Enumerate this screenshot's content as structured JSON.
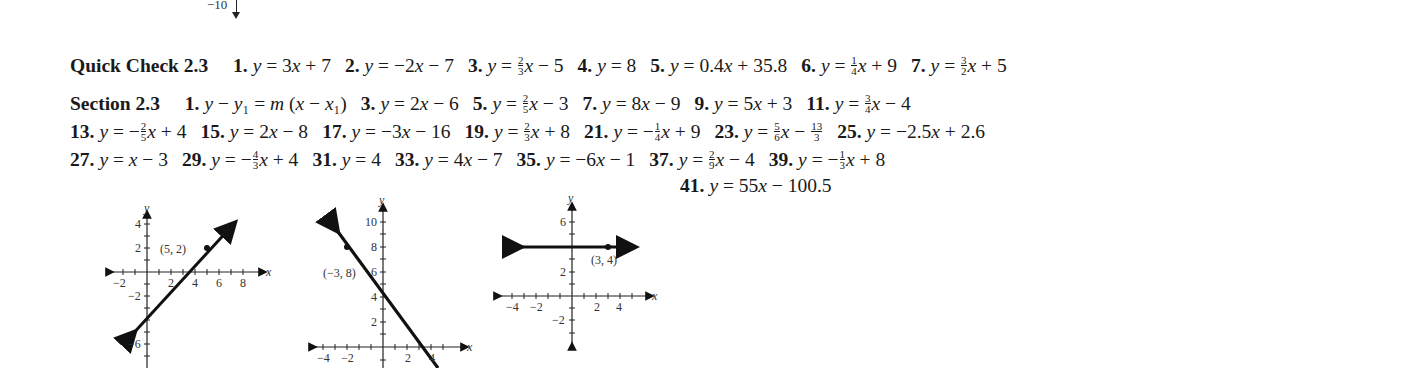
{
  "fragment_top": {
    "label": "−10"
  },
  "quick_check": {
    "heading": "Quick Check 2.3",
    "answers": [
      {
        "num": "1.",
        "pre": "y = 3x + 7"
      },
      {
        "num": "2.",
        "pre": "y = −2x − 7"
      },
      {
        "num": "3.",
        "pre": "y = ",
        "frac": [
          "2",
          "3"
        ],
        "post": "x − 5"
      },
      {
        "num": "4.",
        "pre": "y = 8"
      },
      {
        "num": "5.",
        "pre": "y = 0.4x + 35.8"
      },
      {
        "num": "6.",
        "pre": "y = ",
        "frac": [
          "1",
          "4"
        ],
        "post": "x + 9"
      },
      {
        "num": "7.",
        "pre": "y = ",
        "frac": [
          "3",
          "2"
        ],
        "post": "x + 5"
      }
    ]
  },
  "section": {
    "heading": "Section 2.3",
    "lines": [
      [
        {
          "num": "1.",
          "pre": "y − y₁ = m (x − x₁)"
        },
        {
          "num": "3.",
          "pre": "y = 2x − 6"
        },
        {
          "num": "5.",
          "pre": "y = ",
          "frac": [
            "2",
            "5"
          ],
          "post": "x − 3"
        },
        {
          "num": "7.",
          "pre": "y = 8x − 9"
        },
        {
          "num": "9.",
          "pre": "y = 5x + 3"
        },
        {
          "num": "11.",
          "pre": "y = ",
          "frac": [
            "3",
            "4"
          ],
          "post": "x − 4"
        }
      ],
      [
        {
          "num": "13.",
          "pre": "y = −",
          "frac": [
            "2",
            "5"
          ],
          "post": "x + 4"
        },
        {
          "num": "15.",
          "pre": "y = 2x − 8"
        },
        {
          "num": "17.",
          "pre": "y = −3x − 16"
        },
        {
          "num": "19.",
          "pre": "y = ",
          "frac": [
            "2",
            "3"
          ],
          "post": "x + 8"
        },
        {
          "num": "21.",
          "pre": "y = −",
          "frac": [
            "1",
            "4"
          ],
          "post": "x + 9"
        },
        {
          "num": "23.",
          "pre": "y = ",
          "frac": [
            "5",
            "6"
          ],
          "post": "x − ",
          "frac2": [
            "13",
            "3"
          ]
        },
        {
          "num": "25.",
          "pre": "y = −2.5x + 2.6"
        }
      ],
      [
        {
          "num": "27.",
          "pre": "y = x − 3"
        },
        {
          "num": "29.",
          "pre": "y = −",
          "frac": [
            "4",
            "3"
          ],
          "post": "x + 4"
        },
        {
          "num": "31.",
          "pre": "y = 4"
        },
        {
          "num": "33.",
          "pre": "y = 4x − 7"
        },
        {
          "num": "35.",
          "pre": "y = −6x − 1"
        },
        {
          "num": "37.",
          "pre": "y = ",
          "frac": [
            "2",
            "9"
          ],
          "post": "x − 4"
        },
        {
          "num": "39.",
          "pre": "y = −",
          "frac": [
            "1",
            "3"
          ],
          "post": "x + 8"
        }
      ],
      [
        {
          "num": "41.",
          "pre": "y = 55x − 100.5"
        }
      ]
    ]
  },
  "graphs": [
    {
      "for_answer": "27",
      "point_label": "(5, 2)",
      "x_ticks": [
        "−2",
        "2",
        "4",
        "6",
        "8"
      ],
      "y_ticks": [
        "4",
        "2",
        "−2",
        "−6"
      ],
      "axis_x": "x",
      "axis_y": "y"
    },
    {
      "for_answer": "29",
      "point_label": "(−3, 8)",
      "x_ticks": [
        "−4",
        "−2",
        "2",
        "4"
      ],
      "y_ticks": [
        "10",
        "8",
        "6",
        "4",
        "2"
      ],
      "axis_x": "x",
      "axis_y": "y"
    },
    {
      "for_answer": "31",
      "point_label": "(3, 4)",
      "x_ticks": [
        "−4",
        "−2",
        "2",
        "4"
      ],
      "y_ticks": [
        "6",
        "2",
        "−2"
      ],
      "axis_x": "x",
      "axis_y": "y"
    }
  ]
}
